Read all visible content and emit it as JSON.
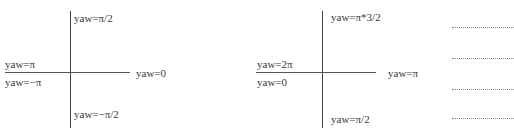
{
  "diagram_left": {
    "top_label": "yaw=π/2",
    "bottom_label": "yaw=−π/2",
    "left_upper_label": "yaw=π",
    "left_lower_label": "yaw=−π",
    "right_label": "yaw=0"
  },
  "diagram_right": {
    "top_label": "yaw=π*3/2",
    "bottom_label": "yaw=π/2",
    "left_upper_label": "yaw=2π",
    "left_lower_label": "yaw=0",
    "right_label": "yaw=π"
  },
  "answer_lines": {
    "count": 4
  },
  "colors": {
    "axis": "#555555",
    "text": "#3a3a3a",
    "dotted": "#888888"
  }
}
